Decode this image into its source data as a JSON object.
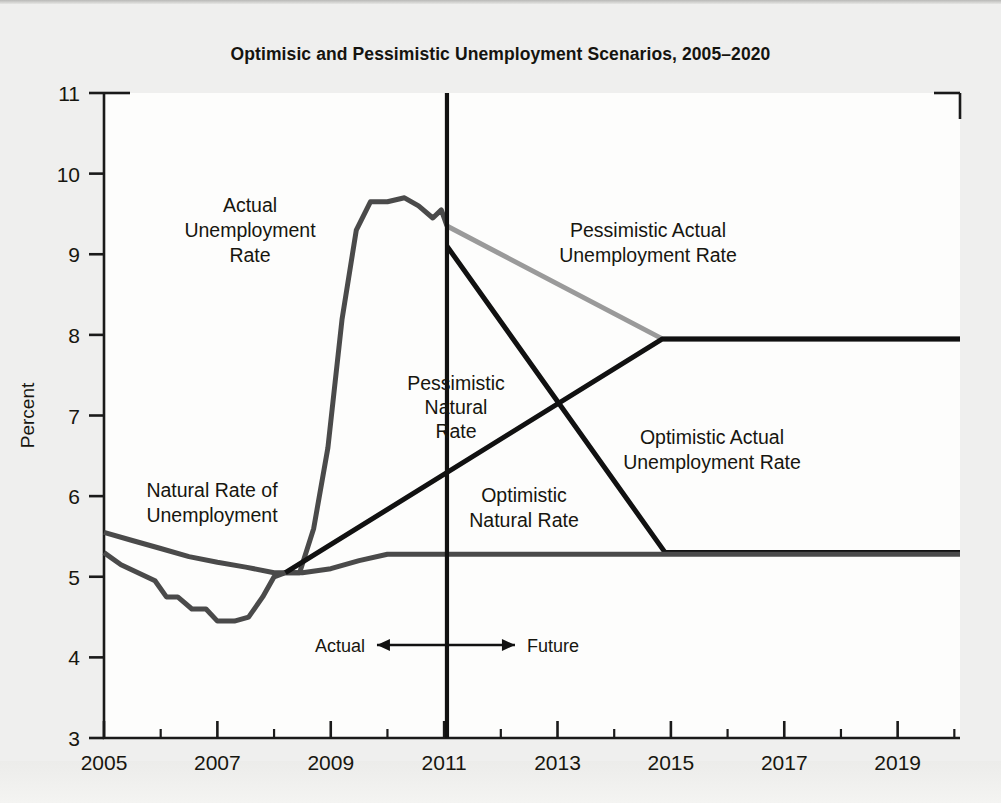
{
  "figure": {
    "title": "Optimisic and Pessimistic Unemployment Scenarios, 2005–2020",
    "background_color": "#efefee",
    "plot_background_color": "#fdfdfc"
  },
  "axes": {
    "y_title": "Percent",
    "y_ticks": [
      "11",
      "10",
      "9",
      "8",
      "7",
      "6",
      "5",
      "4",
      "3"
    ],
    "x_ticks": [
      "2005",
      "2007",
      "2009",
      "2011",
      "2013",
      "2015",
      "2017",
      "2019"
    ]
  },
  "annotations": {
    "actual_rate": "Actual\nUnemployment\nRate",
    "actual_rate_lines": [
      "Actual",
      "Unemployment",
      "Rate"
    ],
    "natural_rate": "Natural Rate of\nUnemployment",
    "natural_rate_lines": [
      "Natural Rate of",
      "Unemployment"
    ],
    "pessimistic_actual_lines": [
      "Pessimistic Actual",
      "Unemployment Rate"
    ],
    "pessimistic_natural_lines": [
      "Pessimistic",
      "Natural",
      "Rate"
    ],
    "optimistic_natural_lines": [
      "Optimistic",
      "Natural Rate"
    ],
    "optimistic_actual_lines": [
      "Optimistic Actual",
      "Unemployment Rate"
    ],
    "divider_left": "Actual",
    "divider_right": "Future"
  },
  "colors": {
    "actual_line": "#4a4a4a",
    "natural_line": "#4a4a4a",
    "pessimistic_actual": "#9a9a9a",
    "projection_black": "#111111",
    "divider": "#111111",
    "axis": "#1a1a1a"
  },
  "chart_data": {
    "type": "line",
    "title": "Optimisic and Pessimistic Unemployment Scenarios, 2005–2020",
    "xlabel": "",
    "ylabel": "Percent",
    "xlim": [
      2005,
      2020.1
    ],
    "ylim": [
      3,
      11
    ],
    "grid": false,
    "legend": "inline-annotations",
    "x_tick_values": [
      2005,
      2007,
      2009,
      2011,
      2013,
      2015,
      2017,
      2019
    ],
    "y_tick_values": [
      3,
      4,
      5,
      6,
      7,
      8,
      9,
      10,
      11
    ],
    "x_minor_tick_values": [
      2006,
      2008,
      2010,
      2012,
      2014,
      2016,
      2018,
      2020
    ],
    "divider_x": 2011.05,
    "series": [
      {
        "name": "Actual Unemployment Rate",
        "color": "#4a4a4a",
        "width": 5,
        "points": [
          [
            2005.0,
            5.3
          ],
          [
            2005.3,
            5.15
          ],
          [
            2005.6,
            5.05
          ],
          [
            2005.9,
            4.95
          ],
          [
            2006.1,
            4.75
          ],
          [
            2006.3,
            4.75
          ],
          [
            2006.55,
            4.6
          ],
          [
            2006.8,
            4.6
          ],
          [
            2007.0,
            4.45
          ],
          [
            2007.3,
            4.45
          ],
          [
            2007.55,
            4.5
          ],
          [
            2007.8,
            4.75
          ],
          [
            2008.0,
            5.0
          ],
          [
            2008.2,
            5.05
          ],
          [
            2008.45,
            5.05
          ],
          [
            2008.7,
            5.6
          ],
          [
            2008.95,
            6.6
          ],
          [
            2009.2,
            8.2
          ],
          [
            2009.45,
            9.3
          ],
          [
            2009.7,
            9.65
          ],
          [
            2010.0,
            9.65
          ],
          [
            2010.3,
            9.7
          ],
          [
            2010.55,
            9.6
          ],
          [
            2010.8,
            9.45
          ],
          [
            2010.95,
            9.55
          ],
          [
            2011.05,
            9.35
          ]
        ]
      },
      {
        "name": "Natural Rate of Unemployment",
        "color": "#4a4a4a",
        "width": 5,
        "points": [
          [
            2005.0,
            5.55
          ],
          [
            2005.5,
            5.45
          ],
          [
            2006.0,
            5.35
          ],
          [
            2006.5,
            5.25
          ],
          [
            2007.0,
            5.18
          ],
          [
            2007.5,
            5.12
          ],
          [
            2008.0,
            5.05
          ],
          [
            2008.5,
            5.05
          ],
          [
            2009.0,
            5.1
          ],
          [
            2009.5,
            5.2
          ],
          [
            2010.0,
            5.28
          ],
          [
            2011.05,
            5.28
          ]
        ]
      },
      {
        "name": "Pessimistic Actual Unemployment Rate",
        "color": "#9a9a9a",
        "width": 5,
        "points": [
          [
            2011.05,
            9.35
          ],
          [
            2014.85,
            7.95
          ],
          [
            2020.1,
            7.95
          ]
        ]
      },
      {
        "name": "Pessimistic Natural Rate",
        "color": "#111111",
        "width": 5,
        "points": [
          [
            2008.2,
            5.05
          ],
          [
            2014.85,
            7.95
          ],
          [
            2020.1,
            7.95
          ]
        ]
      },
      {
        "name": "Optimistic Actual Unemployment Rate",
        "color": "#111111",
        "width": 5,
        "points": [
          [
            2011.05,
            9.1
          ],
          [
            2014.9,
            5.3
          ],
          [
            2020.1,
            5.3
          ]
        ]
      },
      {
        "name": "Optimistic Natural Rate",
        "color": "#4a4a4a",
        "width": 5,
        "points": [
          [
            2011.05,
            5.28
          ],
          [
            2020.1,
            5.28
          ]
        ]
      }
    ]
  }
}
